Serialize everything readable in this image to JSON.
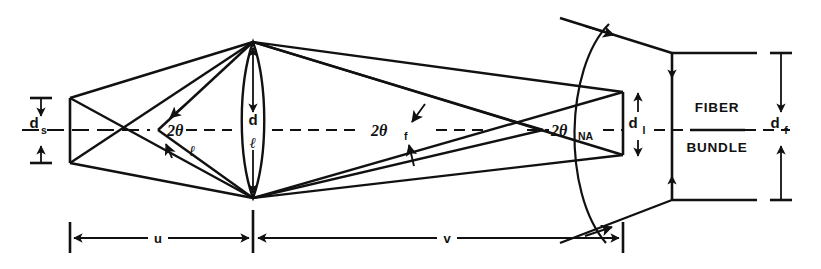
{
  "figure": {
    "background_color": "#ffffff",
    "ink_color": "#111111",
    "width": 821,
    "height": 269
  },
  "labels": {
    "source_diameter": "d",
    "source_diameter_sub": "s",
    "lens_diameter": "d",
    "lens_diameter_sub": "ℓ",
    "image_diameter": "d",
    "image_diameter_sub": "I",
    "fiber_diameter": "d",
    "fiber_diameter_sub": "f",
    "angle_lens": "2θ",
    "angle_lens_sub": "ℓ",
    "angle_fiber": "2θ",
    "angle_fiber_sub": "f",
    "angle_na": "2θ",
    "angle_na_sub": "NA",
    "object_distance": "u",
    "image_distance": "v",
    "bundle_line1": "FIBER",
    "bundle_line2": "BUNDLE"
  },
  "components": [
    {
      "name": "source",
      "label": "d_s",
      "description": "object plane vertical bar at left"
    },
    {
      "name": "lens",
      "label": "d_l",
      "description": "biconvex lens at center"
    },
    {
      "name": "image-plane",
      "label": "d_I",
      "description": "converged image at right"
    },
    {
      "name": "fiber-bundle",
      "label": "FIBER BUNDLE",
      "description": "rectangular fiber bundle at far right"
    }
  ],
  "dimensions": [
    {
      "name": "u",
      "from": "source",
      "to": "lens"
    },
    {
      "name": "v",
      "from": "lens",
      "to": "image-plane"
    },
    {
      "name": "d_s",
      "at": "source"
    },
    {
      "name": "d_l",
      "at": "lens"
    },
    {
      "name": "d_I",
      "at": "image-plane"
    },
    {
      "name": "d_f",
      "at": "fiber-bundle"
    }
  ],
  "angles": [
    {
      "name": "2theta_l",
      "at": "source-axis",
      "label": "2θℓ"
    },
    {
      "name": "2theta_f",
      "at": "mid-axis",
      "label": "2θf"
    },
    {
      "name": "2theta_NA",
      "at": "image-axis",
      "label": "2θNA"
    }
  ]
}
